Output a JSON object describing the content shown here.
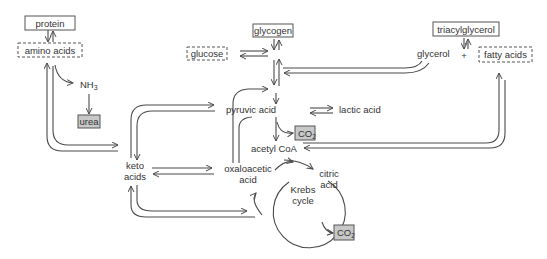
{
  "diagram": {
    "type": "metabolic pathway",
    "nodes": {
      "protein": "protein",
      "amino_acids": "amino acids",
      "nh3": "NH",
      "nh3_sub": "3",
      "urea": "urea",
      "glycogen": "glycogen",
      "glucose": "glucose",
      "triacylglycerol": "triacylglycerol",
      "glycerol": "glycerol",
      "plus": "+",
      "fatty_acids": "fatty acids",
      "pyruvic_acid": "pyruvic acid",
      "lactic_acid": "lactic acid",
      "co2_top": "CO",
      "co2_top_sub": "2",
      "acetyl_coa": "acetyl CoA",
      "keto_line1": "keto",
      "keto_line2": "acids",
      "oxalo_line1": "oxaloacetic",
      "oxalo_line2": "acid",
      "citric_line1": "citric",
      "citric_line2": "acid",
      "krebs_line1": "Krebs",
      "krebs_line2": "cycle",
      "co2_bottom": "CO",
      "co2_bottom_sub": "2"
    },
    "colors": {
      "line": "#4a4a4a",
      "box_border": "#555555",
      "shaded_box": "#c8c8c8"
    }
  }
}
